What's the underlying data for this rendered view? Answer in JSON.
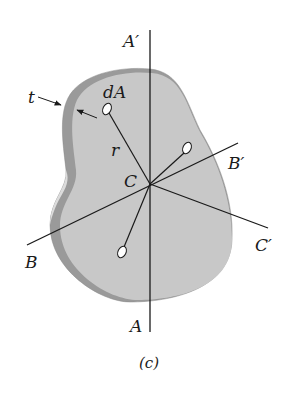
{
  "figure": {
    "caption": "(c)",
    "colors": {
      "plate_face": "#c8c8c8",
      "plate_edge": "#9a9a9a",
      "plate_edge_light": "#dcdcdc",
      "lines": "#1a1a1a",
      "background": "#ffffff"
    }
  },
  "labels": {
    "axis_a_top": "A′",
    "axis_a_bottom": "A",
    "axis_b_right": "B′",
    "axis_b_left": "B",
    "axis_c_right": "C′",
    "center": "C",
    "thickness": "t",
    "area_element": "dA",
    "radius": "r"
  }
}
